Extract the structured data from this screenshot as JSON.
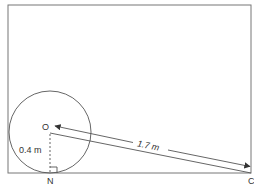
{
  "diagram": {
    "labels": {
      "center": "O",
      "foot": "N",
      "corner": "C",
      "radius": "0.4 m",
      "distance": "1.7 m"
    },
    "colors": {
      "stroke": "#555555",
      "text": "#333333",
      "background": "#ffffff"
    }
  }
}
